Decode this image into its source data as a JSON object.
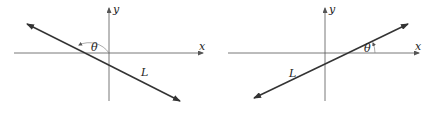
{
  "figures": [
    {
      "id": "left",
      "axis_x_label": "x",
      "axis_y_label": "y",
      "line_label": "L",
      "angle_label": "θ",
      "slope": "negative",
      "angle": "obtuse"
    },
    {
      "id": "right",
      "axis_x_label": "x",
      "axis_y_label": "y",
      "line_label": "L",
      "angle_label": "θ",
      "slope": "positive",
      "angle": "acute"
    }
  ],
  "colors": {
    "axis": "#555555",
    "line": "#333333",
    "arc": "#777777"
  }
}
